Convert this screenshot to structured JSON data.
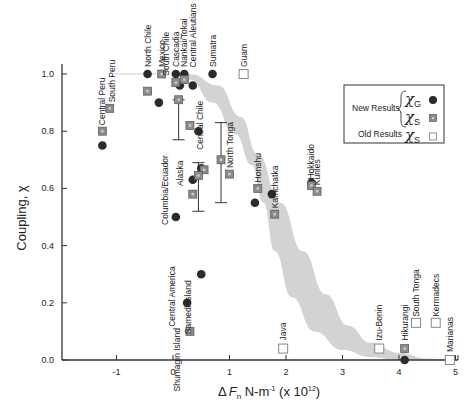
{
  "chart_data": {
    "type": "scatter",
    "title": "",
    "xlabel": "ΔFn N-m⁻¹ (x 10¹²)",
    "ylabel": "Coupling, χ",
    "xlim": [
      -1.95,
      5.0
    ],
    "ylim": [
      0.0,
      1.0
    ],
    "x_ticks": [
      -1,
      0,
      1,
      2,
      3,
      4,
      5
    ],
    "y_ticks": [
      0.0,
      0.2,
      0.4,
      0.6,
      0.8,
      1.0
    ],
    "grid": false,
    "legend": {
      "position": "upper right",
      "entries": [
        {
          "group": "New Results",
          "symbol": "χG",
          "marker": "filled-circle",
          "color": "#2b2b2b"
        },
        {
          "group": "New Results",
          "symbol": "χS",
          "marker": "gray-square",
          "color": "#8c8c8c"
        },
        {
          "group": "Old Results",
          "symbol": "χS",
          "marker": "open-square",
          "color": "#ffffff"
        }
      ]
    },
    "band": {
      "description": "shaded gray trend band",
      "color": "#d3d3d3",
      "upper": [
        [
          -0.5,
          1.0
        ],
        [
          0.3,
          1.0
        ],
        [
          0.8,
          0.96
        ],
        [
          1.2,
          0.85
        ],
        [
          1.5,
          0.72
        ],
        [
          1.9,
          0.55
        ],
        [
          2.3,
          0.38
        ],
        [
          2.7,
          0.23
        ],
        [
          3.1,
          0.12
        ],
        [
          3.5,
          0.06
        ],
        [
          4.0,
          0.025
        ],
        [
          4.5,
          0.005
        ],
        [
          4.9,
          0.0
        ]
      ],
      "lower": [
        [
          0.0,
          1.0
        ],
        [
          0.3,
          0.98
        ],
        [
          0.7,
          0.9
        ],
        [
          1.1,
          0.79
        ],
        [
          1.4,
          0.68
        ],
        [
          1.6,
          0.55
        ],
        [
          1.8,
          0.38
        ],
        [
          2.1,
          0.22
        ],
        [
          2.5,
          0.1
        ],
        [
          3.0,
          0.035
        ],
        [
          3.5,
          0.01
        ],
        [
          4.0,
          0.0
        ],
        [
          4.9,
          0.0
        ]
      ]
    },
    "series": [
      {
        "name": "New Results χG",
        "marker": "filled-circle",
        "points": [
          {
            "label": "Central Peru",
            "x": -1.25,
            "y": 0.75
          },
          {
            "label": "North Chile",
            "x": -0.45,
            "y": 1.0
          },
          {
            "label": "",
            "x": -0.25,
            "y": 0.9
          },
          {
            "label": "Cascadia",
            "x": 0.05,
            "y": 1.0
          },
          {
            "label": "Nankai/Tokai",
            "x": 0.2,
            "y": 1.0
          },
          {
            "label": "",
            "x": 0.12,
            "y": 0.96
          },
          {
            "label": "Central Aleutians",
            "x": 0.35,
            "y": 0.96
          },
          {
            "label": "Sumatra",
            "x": 0.7,
            "y": 1.0
          },
          {
            "label": "Central Chile",
            "x": 0.45,
            "y": 0.8
          },
          {
            "label": "",
            "x": 0.5,
            "y": 0.67
          },
          {
            "label": "Alaska",
            "x": 0.35,
            "y": 0.63
          },
          {
            "label": "Columbia/Ecuador",
            "x": 0.05,
            "y": 0.5
          },
          {
            "label": "Samedi Island",
            "x": 0.5,
            "y": 0.3
          },
          {
            "label": "Central America",
            "x": 0.25,
            "y": 0.2
          },
          {
            "label": "Honshu",
            "x": 1.45,
            "y": 0.55
          },
          {
            "label": "Kamchatka",
            "x": 1.75,
            "y": 0.58
          },
          {
            "label": "Hokkaido",
            "x": 2.45,
            "y": 0.62
          },
          {
            "label": "Hikurangi",
            "x": 4.1,
            "y": 0.0
          }
        ]
      },
      {
        "name": "New Results χS",
        "marker": "gray-square",
        "points": [
          {
            "label": "Central Peru",
            "x": -1.25,
            "y": 0.8
          },
          {
            "label": "South Peru",
            "x": -1.12,
            "y": 0.88
          },
          {
            "label": "",
            "x": -0.45,
            "y": 0.94
          },
          {
            "label": "Mexico",
            "x": -0.2,
            "y": 1.0
          },
          {
            "label": "",
            "x": 0.05,
            "y": 0.97
          },
          {
            "label": "",
            "x": 0.2,
            "y": 0.98
          },
          {
            "label": "South Chile",
            "x": 0.1,
            "y": 0.91
          },
          {
            "label": "",
            "x": 0.3,
            "y": 0.82
          },
          {
            "label": "Central Chile",
            "x": 0.85,
            "y": 0.7
          },
          {
            "label": "",
            "x": 0.55,
            "y": 0.665
          },
          {
            "label": "",
            "x": 0.45,
            "y": 0.645
          },
          {
            "label": "Alaska",
            "x": 0.35,
            "y": 0.58
          },
          {
            "label": "Shumagin Island",
            "x": 0.3,
            "y": 0.1
          },
          {
            "label": "North Tonga",
            "x": 1.0,
            "y": 0.65
          },
          {
            "label": "Honshu",
            "x": 1.5,
            "y": 0.6
          },
          {
            "label": "Kamchatka",
            "x": 1.8,
            "y": 0.51
          },
          {
            "label": "Hokkaido",
            "x": 2.45,
            "y": 0.61
          },
          {
            "label": "Kuriles",
            "x": 2.55,
            "y": 0.59
          },
          {
            "label": "Hikurangi",
            "x": 4.1,
            "y": 0.04
          }
        ]
      },
      {
        "name": "Old Results χS",
        "marker": "open-square",
        "points": [
          {
            "label": "Guam",
            "x": 1.25,
            "y": 1.0
          },
          {
            "label": "Java",
            "x": 1.95,
            "y": 0.04
          },
          {
            "label": "Izu-Bonin",
            "x": 3.65,
            "y": 0.04
          },
          {
            "label": "South Tonga",
            "x": 4.3,
            "y": 0.13
          },
          {
            "label": "Kermadecs",
            "x": 4.65,
            "y": 0.13
          },
          {
            "label": "Marianas",
            "x": 4.9,
            "y": 0.0
          }
        ]
      }
    ],
    "error_bars": [
      {
        "label": "South Chile",
        "x": 0.1,
        "y_low": 0.77,
        "y_high": 0.91
      },
      {
        "label": "Central Chile",
        "x": 0.85,
        "y_low": 0.55,
        "y_high": 0.83
      },
      {
        "label": "Alaska/Samedi",
        "x": 0.45,
        "y_low": 0.52,
        "y_high": 0.69
      }
    ]
  },
  "labels": {
    "y_axis_title": "Coupling, χ",
    "x_axis_title_delta": "Δ",
    "x_axis_title_f": "F",
    "x_axis_title_sub": "n",
    "x_axis_title_rest": " N-m",
    "x_axis_title_exp": "-1",
    "x_axis_title_mult": " (x 10",
    "x_axis_title_mult_exp": "12",
    "x_axis_title_close": ")",
    "legend_new": "New Results",
    "legend_old": "Old Results",
    "legend_chi": "χ",
    "legend_sub_g": "G",
    "legend_sub_s": "S"
  }
}
